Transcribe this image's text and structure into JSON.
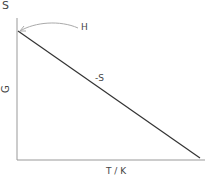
{
  "diagram": {
    "corner_label": "S",
    "y_label": "G",
    "x_label": "T / K",
    "curve_label": "-S",
    "arrow_label": "H",
    "colors": {
      "axis": "#888888",
      "line": "#333333",
      "text": "#444444"
    }
  }
}
